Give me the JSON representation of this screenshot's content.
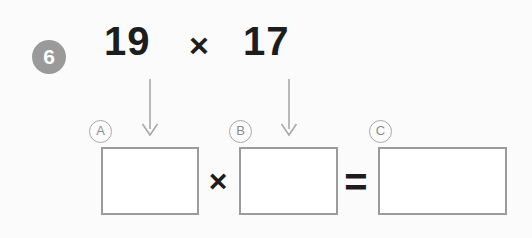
{
  "page": {
    "background_color": "#fbfbfb",
    "ink_color": "#1d1d1d",
    "accent_gray": "#9a9a9a",
    "box_border_color": "#9b9b9b",
    "arrow_color": "#a9a9a9"
  },
  "question": {
    "number": "6",
    "expression": {
      "factor1": "19",
      "operator": "×",
      "factor2": "17"
    }
  },
  "labels": {
    "a": "A",
    "b": "B",
    "c": "C"
  },
  "equation_row": {
    "box_a_value": "",
    "times_operator": "×",
    "box_b_value": "",
    "equals_operator": "=",
    "box_c_value": ""
  },
  "icons": {
    "arrow_down_1": "arrow-down-icon",
    "arrow_down_2": "arrow-down-icon"
  }
}
